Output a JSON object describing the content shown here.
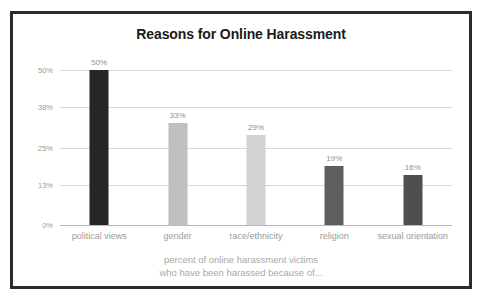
{
  "card": {
    "border_color": "#2b2b2b",
    "background": "#ffffff"
  },
  "chart_data": {
    "type": "bar",
    "title": "Reasons for Online Harassment",
    "subtitle_line1": "percent of online harassment victims",
    "subtitle_line2": "who have been harassed because of...",
    "xlabel": "",
    "ylabel": "",
    "categories": [
      "political views",
      "gender",
      "race/ethnicity",
      "religion",
      "sexual orientation"
    ],
    "values": [
      50,
      33,
      29,
      19,
      16
    ],
    "value_labels": [
      "50%",
      "33%",
      "29%",
      "19%",
      "16%"
    ],
    "bar_colors": [
      "#262626",
      "#bfbfbf",
      "#d2d2d2",
      "#5e5e5e",
      "#4f4f4f"
    ],
    "ylim": [
      0,
      50
    ],
    "yticks": [
      50,
      38,
      25,
      13,
      0
    ],
    "ytick_labels": [
      "50%",
      "38%",
      "25%",
      "13%",
      "0%"
    ],
    "grid": true,
    "legend": false,
    "axis_color": "#b9b9b9",
    "gridline_color": "#d8d8d8",
    "tick_text_color": "#9a9a9a",
    "category_text_color": "#9b9b9b",
    "value_text_color": "#8f8f8f",
    "title_color": "#1a1a1a",
    "caption_color": "#a8a8a8"
  }
}
